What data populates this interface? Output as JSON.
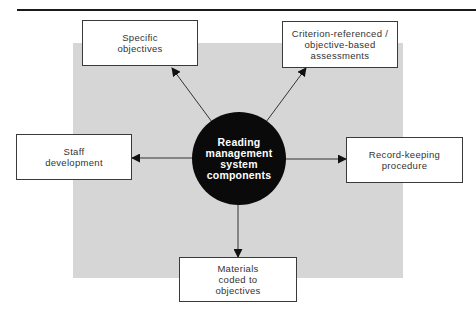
{
  "diagram": {
    "center": {
      "label": "Reading\nmanagement\nsystem\ncomponents"
    },
    "nodes": [
      {
        "id": "specific-objectives",
        "label": "Specific\nobjectives"
      },
      {
        "id": "criterion-referenced-assessments",
        "label": "Criterion-referenced /\nobjective-based\nassessments"
      },
      {
        "id": "staff-development",
        "label": "Staff\ndevelopment"
      },
      {
        "id": "record-keeping-procedure",
        "label": "Record-keeping\nprocedure"
      },
      {
        "id": "materials-coded",
        "label": "Materials\ncoded to\nobjectives"
      }
    ],
    "edges": [
      {
        "from": "center",
        "to": "specific-objectives",
        "direction": "outward"
      },
      {
        "from": "center",
        "to": "criterion-referenced-assessments",
        "direction": "outward"
      },
      {
        "from": "center",
        "to": "staff-development",
        "direction": "outward"
      },
      {
        "from": "center",
        "to": "record-keeping-procedure",
        "direction": "outward"
      },
      {
        "from": "center",
        "to": "materials-coded",
        "direction": "outward"
      }
    ],
    "colors": {
      "panel": "#d6d6d6",
      "hub": "#0a0a0a",
      "hub_text": "#ffffff",
      "node_border": "#3a3a3a",
      "arrow": "#222222"
    }
  }
}
